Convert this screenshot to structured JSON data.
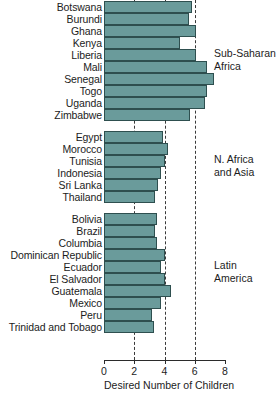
{
  "chart_data": {
    "type": "bar",
    "orientation": "horizontal",
    "title": "",
    "xlabel": "Desired Number of Children",
    "ylabel": "",
    "xlim": [
      0,
      8
    ],
    "xticks": [
      0,
      2,
      4,
      6,
      8
    ],
    "xtick_labels": [
      "0",
      "2",
      "4",
      "6",
      "8"
    ],
    "gridlines": [
      2,
      4,
      6
    ],
    "grid": true,
    "legend": "none",
    "bar_color": "#6a9b9b",
    "bar_edge_color": "#2e4f4f",
    "groups": [
      {
        "name": "Sub-Saharan\nAfrica",
        "categories": [
          "Botswana",
          "Burundi",
          "Ghana",
          "Kenya",
          "Liberia",
          "Mali",
          "Senegal",
          "Togo",
          "Uganda",
          "Zimbabwe"
        ],
        "values": [
          5.8,
          5.6,
          6.1,
          5.0,
          6.1,
          6.8,
          7.3,
          6.8,
          6.7,
          5.7
        ]
      },
      {
        "name": "N. Africa\nand Asia",
        "categories": [
          "Egypt",
          "Morocco",
          "Tunisia",
          "Indonesia",
          "Sri Lanka",
          "Thailand"
        ],
        "values": [
          3.9,
          4.2,
          4.0,
          3.8,
          3.6,
          3.4
        ]
      },
      {
        "name": "Latin\nAmerica",
        "categories": [
          "Bolivia",
          "Brazil",
          "Columbia",
          "Dominican Republic",
          "Ecuador",
          "El Salvador",
          "Guatemala",
          "Mexico",
          "Peru",
          "Trinidad and Tobago"
        ],
        "values": [
          3.5,
          3.4,
          3.5,
          4.0,
          3.8,
          4.0,
          4.4,
          3.8,
          3.2,
          3.3
        ]
      }
    ]
  }
}
